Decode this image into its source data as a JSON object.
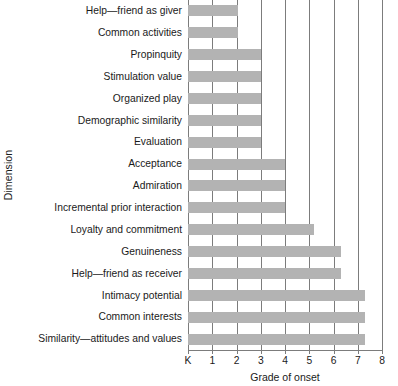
{
  "chart_data": {
    "type": "bar",
    "orientation": "horizontal",
    "title": "",
    "xlabel": "Grade of onset",
    "ylabel": "Dimension",
    "xlim": [
      0,
      8
    ],
    "xticklabels": [
      "K",
      "1",
      "2",
      "3",
      "4",
      "5",
      "6",
      "7",
      "8"
    ],
    "xtickvalues": [
      0,
      1,
      2,
      3,
      4,
      5,
      6,
      7,
      8
    ],
    "grid": true,
    "grid_axis": "x",
    "legend": false,
    "bar_color": "#b3b3b3",
    "axis_color": "#7c7c7c",
    "categories": [
      "Help—friend as giver",
      "Common activities",
      "Propinquity",
      "Stimulation value",
      "Organized play",
      "Demographic similarity",
      "Evaluation",
      "Acceptance",
      "Admiration",
      "Incremental prior interaction",
      "Loyalty and commitment",
      "Genuineness",
      "Help—friend as receiver",
      "Intimacy potential",
      "Common interests",
      "Similarity—attitudes and values"
    ],
    "values": [
      2.05,
      2.05,
      3.0,
      3.0,
      3.0,
      3.0,
      3.0,
      4.0,
      4.0,
      4.0,
      5.2,
      6.3,
      6.3,
      7.3,
      7.3,
      7.3
    ]
  }
}
